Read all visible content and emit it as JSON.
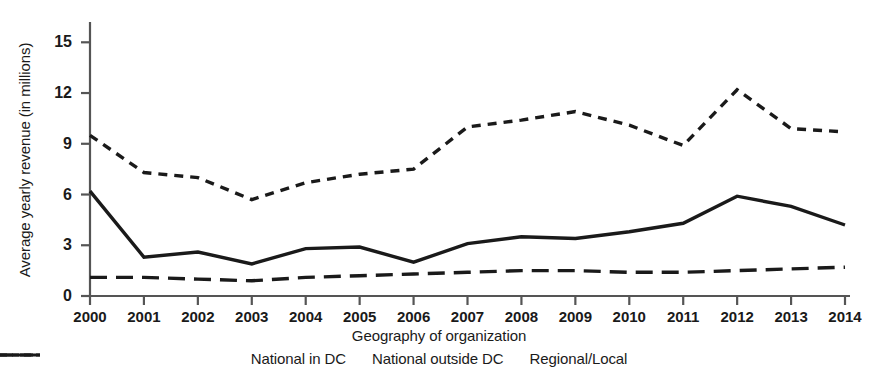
{
  "chart_data": {
    "type": "line",
    "title": "",
    "xlabel": "Geography of organization",
    "ylabel": "Average yearly revenue (in millions)",
    "categories": [
      "2000",
      "2001",
      "2002",
      "2003",
      "2004",
      "2005",
      "2006",
      "2007",
      "2008",
      "2009",
      "2010",
      "2011",
      "2012",
      "2013",
      "2014"
    ],
    "x": [
      2000,
      2001,
      2002,
      2003,
      2004,
      2005,
      2006,
      2007,
      2008,
      2009,
      2010,
      2011,
      2012,
      2013,
      2014
    ],
    "ylim": [
      0,
      16.2
    ],
    "yticks": [
      0,
      3,
      6,
      9,
      12,
      15
    ],
    "ytick_labels": [
      "0",
      "3",
      "6",
      "9",
      "12",
      "15"
    ],
    "grid": false,
    "legend_position": "bottom",
    "series": [
      {
        "name": "National in DC",
        "style": "short-dashed",
        "color": "#1a1a1a",
        "values": [
          9.5,
          7.3,
          7.0,
          5.7,
          6.7,
          7.2,
          7.5,
          10.0,
          10.4,
          10.9,
          10.1,
          8.9,
          12.2,
          9.9,
          9.7
        ]
      },
      {
        "name": "National outside DC",
        "style": "solid",
        "color": "#1a1a1a",
        "values": [
          6.2,
          2.3,
          2.6,
          1.9,
          2.8,
          2.9,
          2.0,
          3.1,
          3.5,
          3.4,
          3.8,
          4.3,
          5.9,
          5.3,
          4.2
        ]
      },
      {
        "name": "Regional/Local",
        "style": "long-dashed",
        "color": "#1a1a1a",
        "values": [
          1.1,
          1.1,
          1.0,
          0.9,
          1.1,
          1.2,
          1.3,
          1.4,
          1.5,
          1.5,
          1.4,
          1.4,
          1.5,
          1.6,
          1.7
        ]
      }
    ]
  },
  "axis": {
    "y_title": "Average yearly revenue (in millions)",
    "x_title": "Geography of organization",
    "y_tick_0": "0",
    "y_tick_1": "3",
    "y_tick_2": "6",
    "y_tick_3": "9",
    "y_tick_4": "12",
    "y_tick_5": "15"
  },
  "legend": {
    "items": [
      {
        "label": "National in DC"
      },
      {
        "label": "National outside DC"
      },
      {
        "label": "Regional/Local"
      }
    ]
  }
}
